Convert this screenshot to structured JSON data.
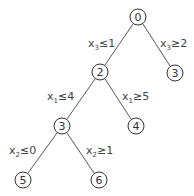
{
  "diagram": {
    "type": "branch-and-bound tree",
    "nodes": [
      {
        "id": "n0",
        "label": "0",
        "x": 138,
        "y": 17
      },
      {
        "id": "n2",
        "label": "2",
        "x": 100,
        "y": 72
      },
      {
        "id": "n3r",
        "label": "3",
        "x": 175,
        "y": 73
      },
      {
        "id": "n3l",
        "label": "3",
        "x": 62,
        "y": 126
      },
      {
        "id": "n4",
        "label": "4",
        "x": 136,
        "y": 126
      },
      {
        "id": "n5",
        "label": "5",
        "x": 23,
        "y": 180
      },
      {
        "id": "n6",
        "label": "6",
        "x": 99,
        "y": 180
      }
    ],
    "edges": [
      {
        "from": "n0",
        "to": "n2",
        "var": "x",
        "sub": "3",
        "rel": "≤1"
      },
      {
        "from": "n0",
        "to": "n3r",
        "var": "x",
        "sub": "3",
        "rel": "≥2"
      },
      {
        "from": "n2",
        "to": "n3l",
        "var": "x",
        "sub": "1",
        "rel": "≤4"
      },
      {
        "from": "n2",
        "to": "n4",
        "var": "x",
        "sub": "1",
        "rel": "≥5"
      },
      {
        "from": "n3l",
        "to": "n5",
        "var": "x",
        "sub": "2",
        "rel": "≤0"
      },
      {
        "from": "n3l",
        "to": "n6",
        "var": "x",
        "sub": "2",
        "rel": "≥1"
      }
    ]
  }
}
